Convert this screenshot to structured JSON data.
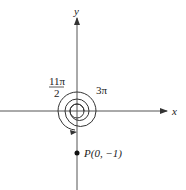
{
  "axes": {
    "x_label": "x",
    "y_label": "y"
  },
  "angles": {
    "outer_label_num": "11π",
    "outer_label_den": "2",
    "inner_label": "3π"
  },
  "point": {
    "label": "P(0, −1)",
    "x": 0,
    "y": -1
  },
  "colors": {
    "line": "#333333",
    "text": "#222222"
  }
}
